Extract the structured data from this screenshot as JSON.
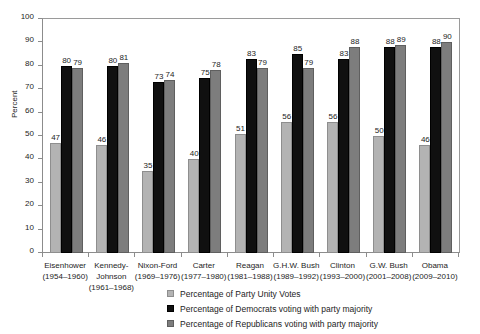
{
  "chart_data": {
    "type": "bar",
    "title": "",
    "xlabel": "",
    "ylabel": "Percent",
    "ylim": [
      0,
      100
    ],
    "ytick_step": 10,
    "yticks": [
      100,
      90,
      80,
      70,
      60,
      50,
      40,
      30,
      20,
      10,
      0
    ],
    "grid": false,
    "legend_position": "bottom-center",
    "categories": [
      "Eisenhower",
      "Kennedy-Johnson",
      "Nixon-Ford",
      "Carter",
      "Reagan",
      "G.H.W. Bush",
      "Clinton",
      "G.W. Bush",
      "Obama"
    ],
    "category_years": [
      "(1954–1960)",
      "(1961–1968)",
      "(1969–1976)",
      "(1977–1980)",
      "(1981–1988)",
      "(1989–1992)",
      "(1993–2000)",
      "(2001–2008)",
      "(2009–2010)"
    ],
    "category_label_lines": [
      [
        "Eisenhower",
        "(1954–1960)"
      ],
      [
        "Kennedy-",
        "Johnson",
        "(1961–1968)"
      ],
      [
        "Nixon-Ford",
        "(1969–1976)"
      ],
      [
        "Carter",
        "(1977–1980)"
      ],
      [
        "Reagan",
        "(1981–1988)"
      ],
      [
        "G.H.W. Bush",
        "(1989–1992)"
      ],
      [
        "Clinton",
        "(1993–2000)"
      ],
      [
        "G.W. Bush",
        "(2001–2008)"
      ],
      [
        "Obama",
        "(2009–2010)"
      ]
    ],
    "series": [
      {
        "name": "Percentage of Party Unity Votes",
        "color": "#b3b3b3",
        "values": [
          47,
          46,
          35,
          40,
          51,
          56,
          56,
          50,
          46
        ]
      },
      {
        "name": "Percentage of Democrats voting with party majority",
        "color": "#101010",
        "values": [
          80,
          80,
          73,
          75,
          83,
          85,
          83,
          88,
          88
        ]
      },
      {
        "name": "Percentage of Republicans voting with party majority",
        "color": "#7d7d7d",
        "values": [
          79,
          81,
          74,
          78,
          79,
          79,
          88,
          89,
          90
        ]
      }
    ]
  },
  "legend": {
    "items": [
      "Percentage of Party Unity Votes",
      "Percentage of Democrats voting with party majority",
      "Percentage of Republicans voting with party majority"
    ]
  }
}
